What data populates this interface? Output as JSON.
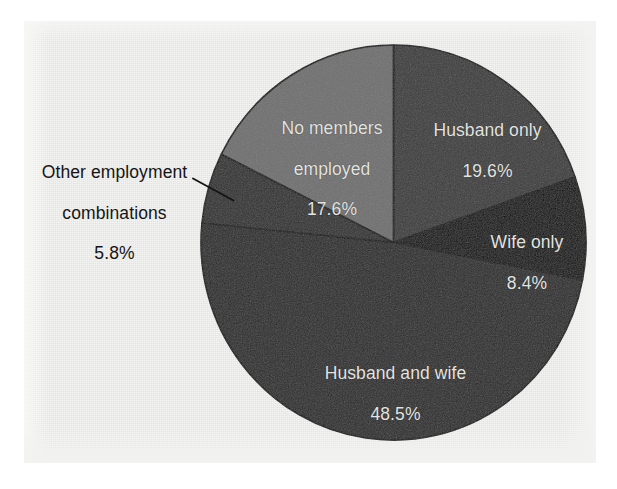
{
  "figure": {
    "background_color": "#e9e9e7",
    "page_color": "#ffffff"
  },
  "chart_data": {
    "type": "pie",
    "title": "",
    "subtitle": "",
    "xlabel": "",
    "ylabel": "",
    "legend_position": "none",
    "grid": false,
    "units": "percent",
    "total": 99.9,
    "start_angle_deg": 0,
    "direction": "clockwise",
    "categories": [
      "Husband only",
      "Wife only",
      "Husband and wife",
      "Other employment combinations",
      "No members employed"
    ],
    "values": [
      19.6,
      8.4,
      48.5,
      5.8,
      17.6
    ],
    "labels": [
      "19.6%",
      "8.4%",
      "48.5%",
      "5.8%",
      "17.6%"
    ],
    "colors": [
      "#3b3b3b",
      "#0b0b0b",
      "#2a2a2a",
      "#303030",
      "#6f6f6f"
    ],
    "slices": [
      {
        "name": "Husband only",
        "value": 19.6,
        "label_text": "Husband only",
        "percent_text": "19.6%",
        "color": "#3b3b3b",
        "text_color": "#e4e4e2",
        "label_placement": "inside",
        "start_deg": 0.0,
        "end_deg": 70.6
      },
      {
        "name": "Wife only",
        "value": 8.4,
        "label_text": "Wife only",
        "percent_text": "8.4%",
        "color": "#0b0b0b",
        "text_color": "#e4e4e2",
        "label_placement": "inside",
        "start_deg": 70.6,
        "end_deg": 100.9
      },
      {
        "name": "Husband and wife",
        "value": 48.5,
        "label_text": "Husband and wife",
        "percent_text": "48.5%",
        "color": "#2a2a2a",
        "text_color": "#e4e4e2",
        "label_placement": "inside",
        "start_deg": 100.9,
        "end_deg": 275.5
      },
      {
        "name": "Other employment combinations",
        "value": 5.8,
        "label_line_1": "Other employment",
        "label_line_2": "combinations",
        "percent_text": "5.8%",
        "color": "#303030",
        "text_color": "#151515",
        "label_placement": "outside",
        "leader_line": true,
        "start_deg": 275.5,
        "end_deg": 296.4
      },
      {
        "name": "No members employed",
        "value": 17.6,
        "label_line_1": "No members",
        "label_line_2": "employed",
        "percent_text": "17.6%",
        "color": "#6f6f6f",
        "text_color": "#e4e4e2",
        "label_placement": "inside",
        "start_deg": 296.4,
        "end_deg": 360.0
      }
    ]
  }
}
